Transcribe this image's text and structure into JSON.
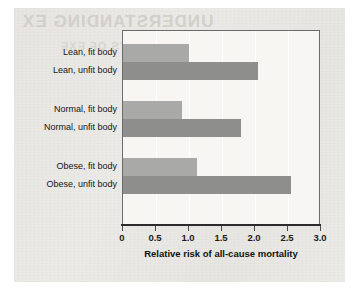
{
  "figure": {
    "ghost_text_top": "UNDERSTANDING EX",
    "ghost_text_sub": "HEALTH BENEFITS OF EXE"
  },
  "chart_data": {
    "type": "bar",
    "orientation": "horizontal",
    "title": "",
    "xlabel": "Relative risk of all-cause mortality",
    "ylabel": "",
    "xlim": [
      0,
      3.0
    ],
    "xticks": [
      "0",
      "0.5",
      "1.0",
      "1.5",
      "2.0",
      "2.5",
      "3.0"
    ],
    "xtick_values": [
      0,
      0.5,
      1.0,
      1.5,
      2.0,
      2.5,
      3.0
    ],
    "grid": true,
    "legend": "none",
    "categories": [
      "Lean, fit body",
      "Lean, unfit body",
      "Normal, fit body",
      "Normal, unfit body",
      "Obese, fit body",
      "Obese, unfit body"
    ],
    "values": [
      1.0,
      2.05,
      0.9,
      1.79,
      1.12,
      2.55
    ],
    "bars": [
      {
        "label": "Lean, fit body",
        "value": 1.0,
        "group": "Lean",
        "fitness": "fit",
        "color": "#a9a9a7"
      },
      {
        "label": "Lean, unfit body",
        "value": 2.05,
        "group": "Lean",
        "fitness": "unfit",
        "color": "#8e8e8c"
      },
      {
        "label": "Normal, fit body",
        "value": 0.9,
        "group": "Normal",
        "fitness": "fit",
        "color": "#a9a9a7"
      },
      {
        "label": "Normal, unfit body",
        "value": 1.79,
        "group": "Normal",
        "fitness": "unfit",
        "color": "#8e8e8c"
      },
      {
        "label": "Obese, fit body",
        "value": 1.12,
        "group": "Obese",
        "fitness": "fit",
        "color": "#a9a9a7"
      },
      {
        "label": "Obese, unfit body",
        "value": 2.55,
        "group": "Obese",
        "fitness": "unfit",
        "color": "#8e8e8c"
      }
    ],
    "colors": {
      "fit_bar": "#a9a9a7",
      "unfit_bar": "#8e8e8c",
      "plot_background": "#f7f6f3",
      "gridline": "#ffffff",
      "axis": "#2b2b2b",
      "page": "#eceae6"
    }
  }
}
